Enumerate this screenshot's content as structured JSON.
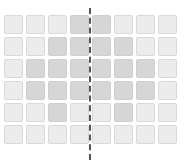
{
  "diagram": {
    "type": "symmetric pixel grid",
    "rows": 6,
    "cols": 8,
    "colors": {
      "light": "#ececec",
      "dark": "#d6d6d6",
      "axis": "#555555"
    },
    "pattern": [
      [
        "L",
        "L",
        "L",
        "D",
        "D",
        "L",
        "L",
        "L"
      ],
      [
        "L",
        "L",
        "D",
        "D",
        "D",
        "D",
        "L",
        "L"
      ],
      [
        "L",
        "D",
        "D",
        "D",
        "D",
        "D",
        "D",
        "L"
      ],
      [
        "L",
        "D",
        "D",
        "D",
        "D",
        "D",
        "D",
        "L"
      ],
      [
        "L",
        "L",
        "D",
        "L",
        "L",
        "D",
        "L",
        "L"
      ],
      [
        "L",
        "L",
        "L",
        "L",
        "L",
        "L",
        "L",
        "L"
      ]
    ],
    "axis": {
      "orientation": "vertical",
      "style": "dashed",
      "position": "center"
    }
  }
}
